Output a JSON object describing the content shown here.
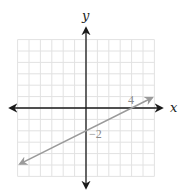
{
  "chart_data": {
    "type": "line",
    "title": "",
    "xlabel": "x",
    "ylabel": "y",
    "xlim": [
      -6,
      6
    ],
    "ylim": [
      -6,
      6
    ],
    "grid": true,
    "grid_step": 1,
    "series": [
      {
        "name": "line",
        "equation": "y = 0.5x - 2",
        "slope": 0.5,
        "y_intercept": -2,
        "x_intercept": 4,
        "x": [
          -5.8,
          5.8
        ],
        "y": [
          -4.9,
          0.9
        ],
        "arrows": "both",
        "color": "#9a9a9a"
      }
    ],
    "annotations": [
      {
        "text": "4",
        "x": 4,
        "y": 0,
        "meaning": "x-intercept"
      },
      {
        "text": "−2",
        "x": 0,
        "y": -2,
        "meaning": "y-intercept"
      }
    ]
  },
  "labels": {
    "x_axis": "x",
    "y_axis": "y",
    "x_intercept": "4",
    "y_intercept": "−2"
  },
  "colors": {
    "grid": "#e2e2e2",
    "axes": "#1a1a1a",
    "line": "#9a9a9a",
    "tick_label": "#8a8a8a"
  }
}
